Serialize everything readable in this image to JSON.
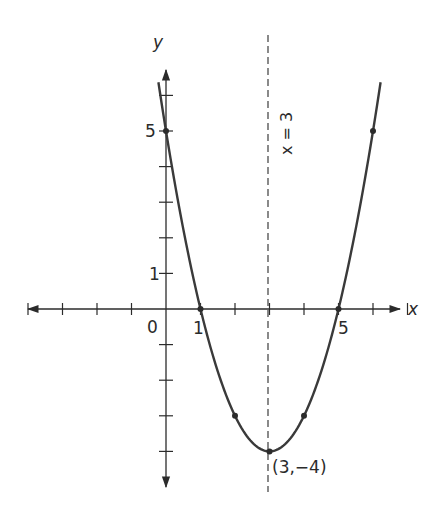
{
  "diagram": {
    "type": "parabola-graph",
    "equation": "y = x^2 - 6x + 5",
    "axes": {
      "x_label": "x",
      "y_label": "y",
      "origin_label": "0",
      "x_tick_labels": [
        {
          "value": 1,
          "text": "1"
        },
        {
          "value": 5,
          "text": "5"
        }
      ],
      "y_tick_labels": [
        {
          "value": 1,
          "text": "1"
        },
        {
          "value": 5,
          "text": "5"
        }
      ],
      "x_ticks": [
        -4,
        -3,
        -2,
        -1,
        1,
        2,
        3,
        4,
        5,
        6,
        7
      ],
      "y_ticks": [
        -4,
        -3,
        -2,
        -1,
        1,
        2,
        3,
        4,
        5,
        6
      ]
    },
    "axis_of_symmetry": {
      "x": 3,
      "label": "x = 3"
    },
    "vertex": {
      "x": 3,
      "y": -4,
      "label": "(3,−4)"
    },
    "marked_points": [
      {
        "x": 0,
        "y": 5
      },
      {
        "x": 1,
        "y": 0
      },
      {
        "x": 2,
        "y": -3
      },
      {
        "x": 3,
        "y": -4
      },
      {
        "x": 4,
        "y": -3
      },
      {
        "x": 5,
        "y": 0
      },
      {
        "x": 6,
        "y": 5
      }
    ],
    "colors": {
      "ink": "#2b2b2b",
      "background": "#ffffff"
    }
  }
}
